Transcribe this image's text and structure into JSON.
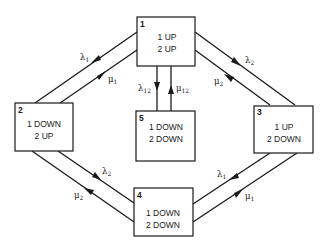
{
  "diagram": {
    "type": "state-transition",
    "states": [
      {
        "id": "1",
        "line1": "1 UP",
        "line2": "2 UP"
      },
      {
        "id": "2",
        "line1": "1 DOWN",
        "line2": "2 UP"
      },
      {
        "id": "3",
        "line1": "1 UP",
        "line2": "2 DOWN"
      },
      {
        "id": "4",
        "line1": "1 DOWN",
        "line2": "2 DOWN"
      },
      {
        "id": "5",
        "line1": "1 DOWN",
        "line2": "2 DOWN"
      }
    ],
    "transitions": [
      {
        "from": "1",
        "to": "2",
        "symbol": "λ",
        "sub": "1"
      },
      {
        "from": "2",
        "to": "1",
        "symbol": "μ",
        "sub": "1"
      },
      {
        "from": "1",
        "to": "3",
        "symbol": "λ",
        "sub": "2"
      },
      {
        "from": "3",
        "to": "1",
        "symbol": "μ",
        "sub": "2"
      },
      {
        "from": "1",
        "to": "5",
        "symbol": "λ",
        "sub": "12"
      },
      {
        "from": "5",
        "to": "1",
        "symbol": "μ",
        "sub": "12"
      },
      {
        "from": "2",
        "to": "4",
        "symbol": "λ",
        "sub": "2"
      },
      {
        "from": "4",
        "to": "2",
        "symbol": "μ",
        "sub": "2"
      },
      {
        "from": "3",
        "to": "4",
        "symbol": "λ",
        "sub": "1"
      },
      {
        "from": "4",
        "to": "3",
        "symbol": "μ",
        "sub": "1"
      }
    ]
  }
}
